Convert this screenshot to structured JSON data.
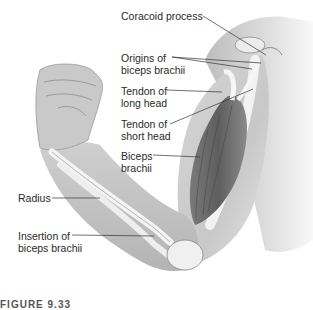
{
  "figure": {
    "caption_partial": "FIGURE 9.33",
    "labels": [
      {
        "id": "coracoid-process",
        "text": "Coracoid process"
      },
      {
        "id": "origins-of-biceps-brachii",
        "line1": "Origins of",
        "line2": "biceps brachii"
      },
      {
        "id": "tendon-of-long-head",
        "line1": "Tendon of",
        "line2": "long head"
      },
      {
        "id": "tendon-of-short-head",
        "line1": "Tendon of",
        "line2": "short head"
      },
      {
        "id": "biceps-brachii",
        "line1": "Biceps",
        "line2": "brachii"
      },
      {
        "id": "radius",
        "text": "Radius"
      },
      {
        "id": "insertion-of-biceps-brachii",
        "line1": "Insertion of",
        "line2": "biceps brachii"
      }
    ],
    "colors": {
      "background": "#ffffff",
      "skin_light": "#e2e2e2",
      "skin_mid": "#c4c4c4",
      "muscle_dark": "#6e6e6e",
      "bone": "#f4f4f4",
      "leader_line": "#333333",
      "text": "#2a2a2a"
    }
  }
}
